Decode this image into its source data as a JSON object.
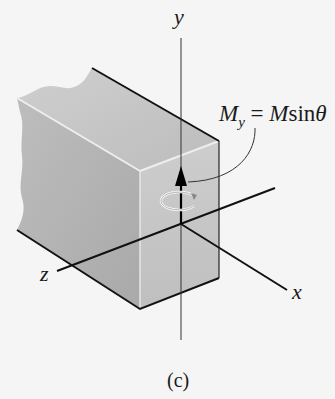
{
  "figure": {
    "caption": "(c)",
    "axes": {
      "y_label": "y",
      "x_label": "x",
      "z_label": "z"
    },
    "moment": {
      "symbol": "M",
      "subscript": "y",
      "equals": " = ",
      "rhs_symbol": "M",
      "rhs_func": "sin",
      "rhs_angle": "θ"
    },
    "colors": {
      "background": "#f5f5f5",
      "block_top": "#c8c8c8",
      "block_side": "#b4b4b4",
      "block_front": "#c4c4c4",
      "edge": "#111111"
    }
  }
}
